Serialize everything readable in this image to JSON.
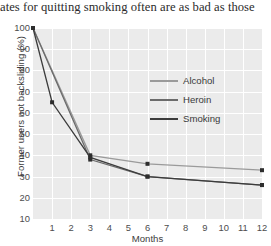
{
  "caption": "ates for quitting smoking often are as bad as those",
  "chart_data": {
    "type": "line",
    "title": "",
    "xlabel": "Months",
    "ylabel": "Former users not backsliding (%)",
    "xlim": [
      0,
      12
    ],
    "ylim": [
      10,
      100
    ],
    "xticks": [
      1,
      2,
      3,
      4,
      5,
      6,
      7,
      8,
      9,
      10,
      11,
      12
    ],
    "yticks": [
      10,
      20,
      30,
      40,
      50,
      60,
      70,
      80,
      90,
      100
    ],
    "grid": true,
    "legend_position": "inside-upper-right",
    "series": [
      {
        "name": "Alcohol",
        "color": "#9a9a9a",
        "x": [
          0,
          3,
          6,
          12
        ],
        "values": [
          100,
          40,
          36,
          33
        ]
      },
      {
        "name": "Heroin",
        "color": "#6b6b6b",
        "x": [
          0,
          3,
          6,
          12
        ],
        "values": [
          100,
          38,
          30,
          26
        ]
      },
      {
        "name": "Smoking",
        "color": "#3c3c3c",
        "x": [
          0,
          1,
          3,
          6,
          12
        ],
        "values": [
          100,
          65,
          39,
          30,
          26
        ]
      }
    ]
  },
  "colors": {
    "panel_background": "#ebebeb",
    "gridline": "#ffffff",
    "tick_text": "#4d4d4d",
    "axis_title": "#3d3d3d"
  }
}
